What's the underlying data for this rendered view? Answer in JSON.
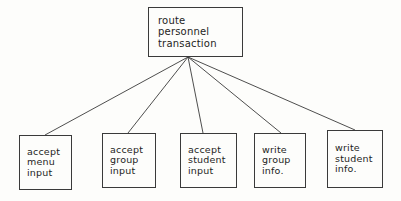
{
  "diagram": {
    "type": "structure-chart",
    "background_color": "#fdfdfb",
    "line_color": "#3a3a3a",
    "text_color": "#1d1d1d",
    "root": {
      "id": "route-personnel-transaction",
      "lines": [
        "route",
        "personnel",
        "transaction"
      ],
      "box": {
        "x": 148,
        "y": 7,
        "w": 95,
        "h": 50
      }
    },
    "children": [
      {
        "id": "accept-menu-input",
        "lines": [
          "accept",
          "menu",
          "input"
        ],
        "box": {
          "x": 19,
          "y": 135,
          "w": 53,
          "h": 55
        },
        "connector": {
          "x1": 188,
          "y1": 57,
          "x2": 45,
          "y2": 135
        }
      },
      {
        "id": "accept-group-input",
        "lines": [
          "accept",
          "group",
          "input"
        ],
        "box": {
          "x": 102,
          "y": 133,
          "w": 54,
          "h": 55
        },
        "connector": {
          "x1": 188,
          "y1": 57,
          "x2": 128,
          "y2": 133
        }
      },
      {
        "id": "accept-student-input",
        "lines": [
          "accept",
          "student",
          "input"
        ],
        "box": {
          "x": 180,
          "y": 133,
          "w": 57,
          "h": 55
        },
        "connector": {
          "x1": 188,
          "y1": 57,
          "x2": 203,
          "y2": 133
        }
      },
      {
        "id": "write-group-info",
        "lines": [
          "write",
          "group",
          "info."
        ],
        "box": {
          "x": 254,
          "y": 133,
          "w": 52,
          "h": 55
        },
        "connector": {
          "x1": 188,
          "y1": 57,
          "x2": 281,
          "y2": 133
        }
      },
      {
        "id": "write-student-info",
        "lines": [
          "write",
          "student",
          "info."
        ],
        "box": {
          "x": 327,
          "y": 130,
          "w": 56,
          "h": 58
        },
        "connector": {
          "x1": 188,
          "y1": 57,
          "x2": 355,
          "y2": 130
        }
      }
    ]
  }
}
